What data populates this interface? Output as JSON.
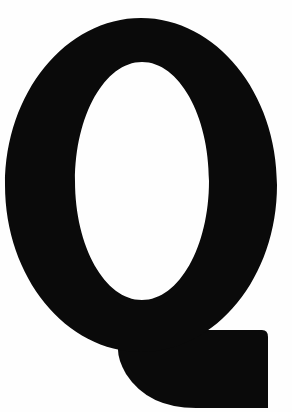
{
  "image": {
    "kind": "letterform-glyph",
    "subject_name": "letter-q",
    "character": "Q",
    "case": "uppercase",
    "script": "Latin",
    "style": "bold serif-less slab tail",
    "width": 292,
    "height": 412,
    "alt_text": "Large black uppercase letter Q on a white background"
  },
  "colors": {
    "background": "#fefefe",
    "glyph": "#0a0a0a",
    "counter": "#ffffff",
    "edge_shadow": "#1a1a1a"
  },
  "geometry": {
    "outer_bowl": {
      "center_x": 141,
      "center_y": 185,
      "radius_x": 136,
      "radius_y": 167,
      "left": 5,
      "right": 277,
      "top": 18,
      "bottom": 352
    },
    "counter": {
      "center_x": 142,
      "center_y": 181,
      "radius_x": 67,
      "radius_y": 119,
      "left": 75,
      "right": 209,
      "top": 62,
      "bottom": 300
    },
    "tail": {
      "left": 118,
      "right": 268,
      "top": 330,
      "bottom": 408,
      "corner_radius": 34,
      "description": "thick blocky tail sweeping from lower-right of bowl, flat right edge, rounded bottom-left"
    }
  }
}
